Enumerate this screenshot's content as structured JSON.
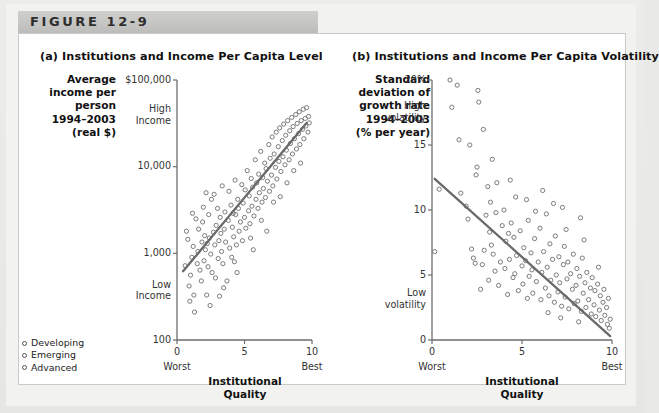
{
  "figure": {
    "band_label": "FIGURE 12-9"
  },
  "legend": {
    "items": [
      {
        "label": "Developing",
        "marker": "open-circle-icon"
      },
      {
        "label": "Emerging",
        "marker": "open-circle-icon"
      },
      {
        "label": "Advanced",
        "marker": "open-circle-icon"
      }
    ]
  },
  "panel_a": {
    "title": "(a) Institutions and Income Per Capita Level",
    "ylabel": "Average\nincome per\nperson\n1994–2003\n(real $)",
    "xaxis_title": "Institutional\nQuality",
    "x_worst": "Worst",
    "x_best": "Best"
  },
  "panel_b": {
    "title": "(b) Institutions and Income Per Capita Volatility",
    "ylabel": "Standard\ndeviation of\ngrowth rate\n1994–2003\n(% per year)",
    "xaxis_title": "Institutional\nQuality",
    "x_worst": "Worst",
    "x_best": "Best"
  },
  "chart_data": [
    {
      "type": "scatter",
      "id": "panel-a",
      "title": "(a) Institutions and Income Per Capita Level",
      "xlabel": "Institutional Quality",
      "ylabel": "Average income per person 1994–2003 (real $)",
      "xlim": [
        0,
        10
      ],
      "ylim": [
        100,
        100000
      ],
      "yscale": "log",
      "grid": false,
      "legend_position": "bottom-left-outside",
      "xticks": [
        0,
        5,
        10
      ],
      "xticklabels": [
        "0",
        "5",
        "10"
      ],
      "yticks": [
        100,
        1000,
        10000,
        100000
      ],
      "yticklabels": [
        "100",
        "1,000",
        "10,000",
        "$100,000"
      ],
      "y_annotations": [
        {
          "text": "High\nIncome",
          "value": 40000
        },
        {
          "text": "Low\nIncome",
          "value": 380
        }
      ],
      "x_annotations": [
        {
          "text": "Worst",
          "value": 0
        },
        {
          "text": "Best",
          "value": 10
        }
      ],
      "trendline": {
        "x": [
          0.45,
          9.6
        ],
        "y": [
          620,
          32000
        ],
        "style": "solid"
      },
      "points": [
        [
          0.6,
          720
        ],
        [
          0.8,
          1450
        ],
        [
          0.9,
          420
        ],
        [
          1.0,
          560
        ],
        [
          1.1,
          900
        ],
        [
          1.2,
          1200
        ],
        [
          1.25,
          330
        ],
        [
          1.4,
          2500
        ],
        [
          1.5,
          760
        ],
        [
          1.55,
          1050
        ],
        [
          1.6,
          1900
        ],
        [
          1.7,
          640
        ],
        [
          1.8,
          480
        ],
        [
          1.85,
          1350
        ],
        [
          1.9,
          2300
        ],
        [
          2.0,
          820
        ],
        [
          2.05,
          1600
        ],
        [
          2.1,
          1100
        ],
        [
          2.2,
          330
        ],
        [
          2.3,
          700
        ],
        [
          2.35,
          2800
        ],
        [
          2.4,
          1500
        ],
        [
          2.5,
          980
        ],
        [
          2.55,
          4200
        ],
        [
          2.6,
          600
        ],
        [
          2.7,
          1750
        ],
        [
          2.8,
          1250
        ],
        [
          2.85,
          520
        ],
        [
          2.9,
          2100
        ],
        [
          3.0,
          3300
        ],
        [
          3.05,
          870
        ],
        [
          3.1,
          1400
        ],
        [
          3.2,
          2600
        ],
        [
          3.3,
          1050
        ],
        [
          3.35,
          6000
        ],
        [
          3.4,
          760
        ],
        [
          3.5,
          1900
        ],
        [
          3.55,
          3000
        ],
        [
          3.6,
          1350
        ],
        [
          3.7,
          480
        ],
        [
          3.8,
          2400
        ],
        [
          3.85,
          5200
        ],
        [
          3.9,
          1150
        ],
        [
          4.0,
          3600
        ],
        [
          4.05,
          900
        ],
        [
          4.1,
          2000
        ],
        [
          4.2,
          1550
        ],
        [
          4.3,
          7000
        ],
        [
          4.35,
          2800
        ],
        [
          4.4,
          1250
        ],
        [
          4.5,
          4200
        ],
        [
          4.55,
          3300
        ],
        [
          4.6,
          1800
        ],
        [
          4.7,
          2300
        ],
        [
          4.8,
          6200
        ],
        [
          4.85,
          1400
        ],
        [
          4.9,
          3800
        ],
        [
          5.0,
          2600
        ],
        [
          5.05,
          5400
        ],
        [
          5.1,
          1950
        ],
        [
          5.2,
          9000
        ],
        [
          5.3,
          3100
        ],
        [
          5.35,
          4600
        ],
        [
          5.4,
          2200
        ],
        [
          5.5,
          7300
        ],
        [
          5.55,
          3500
        ],
        [
          5.6,
          5800
        ],
        [
          5.7,
          2700
        ],
        [
          5.8,
          12000
        ],
        [
          5.85,
          4200
        ],
        [
          5.9,
          6500
        ],
        [
          6.0,
          3300
        ],
        [
          6.05,
          8200
        ],
        [
          6.1,
          5000
        ],
        [
          6.2,
          15000
        ],
        [
          6.3,
          3900
        ],
        [
          6.35,
          7500
        ],
        [
          6.4,
          5600
        ],
        [
          6.5,
          11000
        ],
        [
          6.55,
          4400
        ],
        [
          6.6,
          9500
        ],
        [
          6.7,
          6800
        ],
        [
          6.8,
          18000
        ],
        [
          6.85,
          5200
        ],
        [
          6.9,
          12500
        ],
        [
          7.0,
          8000
        ],
        [
          7.05,
          22000
        ],
        [
          7.1,
          6000
        ],
        [
          7.2,
          14000
        ],
        [
          7.3,
          9800
        ],
        [
          7.35,
          25000
        ],
        [
          7.4,
          7200
        ],
        [
          7.5,
          17000
        ],
        [
          7.55,
          11500
        ],
        [
          7.6,
          28000
        ],
        [
          7.7,
          8800
        ],
        [
          7.8,
          20000
        ],
        [
          7.85,
          13000
        ],
        [
          7.9,
          31000
        ],
        [
          8.0,
          10500
        ],
        [
          8.05,
          23000
        ],
        [
          8.1,
          15500
        ],
        [
          8.2,
          34000
        ],
        [
          8.3,
          12000
        ],
        [
          8.35,
          26000
        ],
        [
          8.4,
          18500
        ],
        [
          8.5,
          37000
        ],
        [
          8.55,
          14000
        ],
        [
          8.6,
          29000
        ],
        [
          8.7,
          21000
        ],
        [
          8.8,
          40000
        ],
        [
          8.85,
          16000
        ],
        [
          8.9,
          31500
        ],
        [
          9.0,
          24000
        ],
        [
          9.05,
          43000
        ],
        [
          9.1,
          18000
        ],
        [
          9.2,
          34000
        ],
        [
          9.3,
          27000
        ],
        [
          9.35,
          46000
        ],
        [
          9.4,
          21000
        ],
        [
          9.5,
          36000
        ],
        [
          9.55,
          29500
        ],
        [
          9.6,
          48000
        ],
        [
          9.7,
          25000
        ],
        [
          9.75,
          38000
        ],
        [
          9.8,
          32000
        ],
        [
          1.3,
          210
        ],
        [
          2.45,
          250
        ],
        [
          3.15,
          320
        ],
        [
          0.7,
          1800
        ],
        [
          1.95,
          3400
        ],
        [
          2.75,
          4800
        ],
        [
          4.25,
          800
        ],
        [
          5.45,
          1500
        ],
        [
          6.25,
          2400
        ],
        [
          7.15,
          3900
        ],
        [
          8.15,
          6500
        ],
        [
          9.15,
          11000
        ],
        [
          3.45,
          400
        ],
        [
          4.45,
          600
        ],
        [
          5.65,
          1100
        ],
        [
          6.65,
          1800
        ],
        [
          7.65,
          4500
        ],
        [
          8.65,
          9000
        ],
        [
          1.15,
          2900
        ],
        [
          2.15,
          5000
        ],
        [
          0.95,
          280
        ],
        [
          2.25,
          1300
        ],
        [
          3.25,
          1700
        ],
        [
          4.15,
          2900
        ]
      ]
    },
    {
      "type": "scatter",
      "id": "panel-b",
      "title": "(b) Institutions and Income Per Capita Volatility",
      "xlabel": "Institutional Quality",
      "ylabel": "Standard deviation of growth rate 1994–2003 (% per year)",
      "xlim": [
        0,
        10
      ],
      "ylim": [
        0,
        20
      ],
      "yscale": "linear",
      "grid": false,
      "xticks": [
        0,
        5,
        10
      ],
      "xticklabels": [
        "0",
        "5",
        "10"
      ],
      "yticks": [
        0,
        5,
        10,
        15,
        20
      ],
      "yticklabels": [
        "0",
        "5",
        "10",
        "15",
        "20%"
      ],
      "y_annotations": [
        {
          "text": "High\nvolatility",
          "value": 17.6
        },
        {
          "text": "Low\nvolatility",
          "value": 3.2
        }
      ],
      "x_annotations": [
        {
          "text": "Worst",
          "value": 0
        },
        {
          "text": "Best",
          "value": 10
        }
      ],
      "trendline": {
        "x": [
          0.15,
          9.9
        ],
        "y": [
          12.4,
          0.3
        ],
        "style": "solid"
      },
      "points": [
        [
          0.15,
          6.8
        ],
        [
          0.4,
          11.6
        ],
        [
          1.0,
          20.0
        ],
        [
          1.1,
          17.9
        ],
        [
          1.5,
          15.4
        ],
        [
          1.6,
          11.3
        ],
        [
          1.9,
          10.3
        ],
        [
          2.0,
          9.3
        ],
        [
          2.1,
          15.0
        ],
        [
          2.2,
          7.0
        ],
        [
          2.3,
          6.3
        ],
        [
          2.4,
          5.9
        ],
        [
          2.5,
          13.3
        ],
        [
          2.55,
          19.2
        ],
        [
          2.6,
          18.3
        ],
        [
          2.7,
          3.9
        ],
        [
          2.8,
          5.8
        ],
        [
          2.9,
          6.9
        ],
        [
          3.0,
          9.6
        ],
        [
          3.1,
          11.8
        ],
        [
          3.2,
          8.3
        ],
        [
          3.25,
          10.6
        ],
        [
          3.3,
          7.3
        ],
        [
          3.4,
          6.6
        ],
        [
          3.5,
          5.3
        ],
        [
          3.55,
          9.8
        ],
        [
          3.6,
          12.1
        ],
        [
          3.7,
          4.2
        ],
        [
          3.8,
          6.0
        ],
        [
          3.9,
          8.8
        ],
        [
          4.0,
          10.0
        ],
        [
          4.05,
          5.5
        ],
        [
          4.1,
          7.6
        ],
        [
          4.2,
          3.5
        ],
        [
          4.3,
          6.2
        ],
        [
          4.4,
          9.0
        ],
        [
          4.5,
          4.8
        ],
        [
          4.55,
          7.9
        ],
        [
          4.6,
          5.1
        ],
        [
          4.7,
          6.5
        ],
        [
          4.8,
          3.8
        ],
        [
          4.9,
          8.4
        ],
        [
          5.0,
          5.7
        ],
        [
          5.05,
          4.3
        ],
        [
          5.1,
          7.1
        ],
        [
          5.2,
          6.1
        ],
        [
          5.3,
          3.2
        ],
        [
          5.35,
          9.2
        ],
        [
          5.4,
          4.9
        ],
        [
          5.5,
          6.7
        ],
        [
          5.55,
          5.4
        ],
        [
          5.6,
          3.6
        ],
        [
          5.7,
          7.8
        ],
        [
          5.8,
          4.5
        ],
        [
          5.9,
          6.0
        ],
        [
          6.0,
          8.6
        ],
        [
          6.05,
          3.1
        ],
        [
          6.1,
          5.2
        ],
        [
          6.2,
          6.8
        ],
        [
          6.3,
          4.0
        ],
        [
          6.35,
          9.7
        ],
        [
          6.4,
          5.6
        ],
        [
          6.5,
          3.4
        ],
        [
          6.55,
          7.4
        ],
        [
          6.6,
          4.6
        ],
        [
          6.7,
          6.2
        ],
        [
          6.8,
          2.9
        ],
        [
          6.85,
          8.0
        ],
        [
          6.9,
          5.0
        ],
        [
          7.0,
          3.7
        ],
        [
          7.05,
          6.4
        ],
        [
          7.1,
          4.4
        ],
        [
          7.2,
          2.6
        ],
        [
          7.3,
          5.8
        ],
        [
          7.35,
          7.2
        ],
        [
          7.4,
          3.3
        ],
        [
          7.5,
          4.7
        ],
        [
          7.55,
          6.0
        ],
        [
          7.6,
          2.4
        ],
        [
          7.7,
          5.1
        ],
        [
          7.8,
          3.9
        ],
        [
          7.85,
          6.6
        ],
        [
          7.9,
          2.8
        ],
        [
          8.0,
          4.2
        ],
        [
          8.05,
          5.5
        ],
        [
          8.1,
          3.0
        ],
        [
          8.2,
          4.9
        ],
        [
          8.3,
          2.2
        ],
        [
          8.35,
          6.3
        ],
        [
          8.4,
          3.6
        ],
        [
          8.5,
          4.4
        ],
        [
          8.55,
          2.5
        ],
        [
          8.6,
          5.2
        ],
        [
          8.7,
          3.1
        ],
        [
          8.8,
          4.0
        ],
        [
          8.85,
          2.0
        ],
        [
          8.9,
          4.8
        ],
        [
          9.0,
          2.7
        ],
        [
          9.05,
          3.8
        ],
        [
          9.1,
          1.8
        ],
        [
          9.2,
          4.3
        ],
        [
          9.3,
          2.3
        ],
        [
          9.35,
          3.4
        ],
        [
          9.4,
          1.5
        ],
        [
          9.5,
          2.9
        ],
        [
          9.55,
          3.9
        ],
        [
          9.6,
          1.9
        ],
        [
          9.7,
          2.5
        ],
        [
          9.75,
          1.2
        ],
        [
          9.8,
          3.2
        ],
        [
          9.85,
          0.9
        ],
        [
          9.9,
          1.6
        ],
        [
          2.45,
          12.7
        ],
        [
          3.35,
          13.9
        ],
        [
          4.35,
          12.3
        ],
        [
          5.25,
          10.8
        ],
        [
          6.15,
          11.5
        ],
        [
          7.25,
          10.2
        ],
        [
          8.25,
          9.4
        ],
        [
          9.25,
          5.6
        ],
        [
          1.4,
          19.6
        ],
        [
          4.65,
          11.0
        ],
        [
          5.75,
          9.9
        ],
        [
          6.75,
          10.5
        ],
        [
          7.45,
          8.5
        ],
        [
          8.45,
          7.7
        ],
        [
          3.15,
          4.6
        ],
        [
          4.25,
          8.2
        ],
        [
          2.85,
          16.2
        ],
        [
          6.45,
          2.1
        ],
        [
          7.15,
          1.7
        ],
        [
          8.15,
          1.4
        ]
      ]
    }
  ]
}
